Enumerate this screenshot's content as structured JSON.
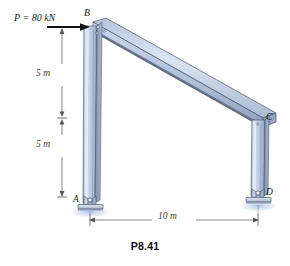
{
  "figure": {
    "caption": "P8.41",
    "type": "structural-frame-diagram"
  },
  "load": {
    "label": "P = 80 kN",
    "magnitude": 80,
    "unit": "kN",
    "symbol": "P",
    "direction": "right",
    "applied_at": "B"
  },
  "joints": {
    "A": "A",
    "B": "B",
    "C": "C",
    "D": "D"
  },
  "dimensions": {
    "upper_vertical": "5 m",
    "lower_vertical": "5 m",
    "horizontal": "10 m"
  },
  "colors": {
    "member_light": "#cfdaeb",
    "member_mid": "#9fb4d2",
    "member_dark": "#58657a",
    "member_edge": "#3f4a5c",
    "support_base": "#b9c7dd",
    "dimension_line": "#55555a",
    "text": "#1a1a1a"
  },
  "geometry": {
    "A": [
      88,
      205
    ],
    "B": [
      92,
      27
    ],
    "C": [
      262,
      122
    ],
    "D": [
      256,
      199
    ]
  }
}
